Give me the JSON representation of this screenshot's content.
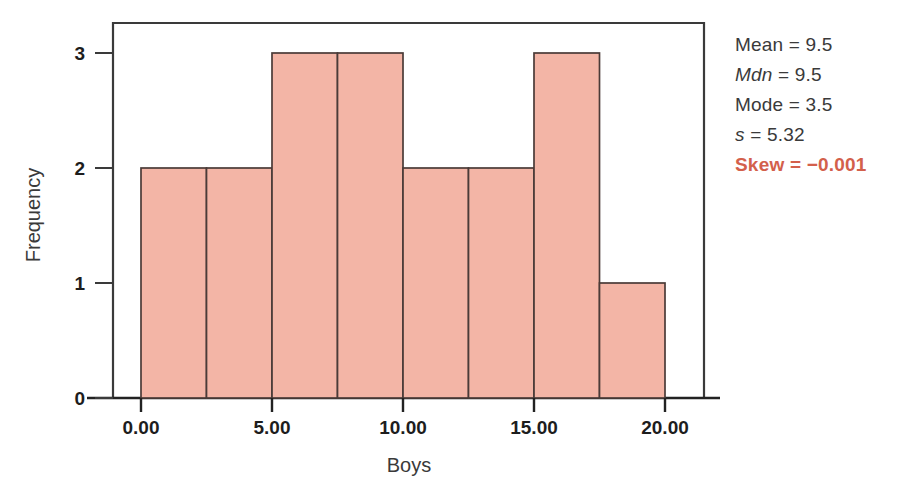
{
  "chart_data": {
    "type": "bar",
    "title": "",
    "xlabel": "Boys",
    "ylabel": "Frequency",
    "xlim": [
      -0.6,
      21.5
    ],
    "ylim": [
      0,
      3.26
    ],
    "xticks": [
      0,
      5,
      10,
      15,
      20
    ],
    "xtick_labels": [
      "0.00",
      "5.00",
      "10.00",
      "15.00",
      "20.00"
    ],
    "yticks": [
      0,
      1,
      2,
      3
    ],
    "ytick_labels": [
      "0",
      "1",
      "2",
      "3"
    ],
    "grid": false,
    "legend": null,
    "bin_width": 2.5,
    "bin_edges": [
      0,
      2.5,
      5,
      7.5,
      10,
      12.5,
      15,
      17.5,
      20
    ],
    "categories": [
      "0.00-2.50",
      "2.50-5.00",
      "5.00-7.50",
      "7.50-10.00",
      "10.00-12.50",
      "12.50-15.00",
      "15.00-17.50",
      "17.50-20.00"
    ],
    "values": [
      2,
      2,
      3,
      3,
      2,
      2,
      3,
      1
    ],
    "bar_fill_color": "#f3b5a6",
    "bar_edge_color": "#4a3b38",
    "frame_color": "#3a3a3a"
  },
  "stats": {
    "items": [
      {
        "symbol": "Mean",
        "equals": "=",
        "value": "9.5",
        "italic": false,
        "highlight": false
      },
      {
        "symbol": "Mdn",
        "equals": "=",
        "value": "9.5",
        "italic": true,
        "highlight": false
      },
      {
        "symbol": "Mode",
        "equals": "=",
        "value": "3.5",
        "italic": false,
        "highlight": false
      },
      {
        "symbol": "s",
        "equals": "=",
        "value": "5.32",
        "italic": true,
        "highlight": false
      },
      {
        "symbol": "Skew",
        "equals": "=",
        "value": "−0.001",
        "italic": false,
        "highlight": true
      }
    ],
    "lines": [
      "Mean = 9.5",
      "Mdn = 9.5",
      "Mode = 3.5",
      "s = 5.32",
      "Skew = −0.001"
    ],
    "highlight_color": "#d3604b",
    "text_color": "#3a3a3a"
  }
}
